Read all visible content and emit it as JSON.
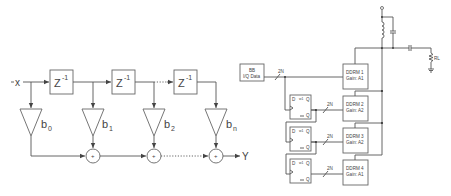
{
  "left_diagram": {
    "title": "FIR filter (tapped delay line)",
    "input_label": "x",
    "output_label": "Y",
    "delay_label": "Z",
    "delay_exponent": "-1",
    "adder_symbol": "+",
    "coefficients": [
      {
        "base": "b",
        "sub": "0"
      },
      {
        "base": "b",
        "sub": "1"
      },
      {
        "base": "b",
        "sub": "2"
      },
      {
        "base": "b",
        "sub": "n"
      }
    ]
  },
  "right_diagram": {
    "source_block": {
      "line1": "BB",
      "line2": "I/Q Data"
    },
    "bus_label": "2N",
    "flipflop": {
      "d": "D",
      "q": "Q",
      "qbar": "Q",
      "clk_mark": "w1"
    },
    "ddrm_blocks": [
      {
        "name": "DDRM 1",
        "gain": "Gain: A1"
      },
      {
        "name": "DDRM 2",
        "gain": "Gain: A2"
      },
      {
        "name": "DDRM 3",
        "gain": "Gain: A2"
      },
      {
        "name": "DDRM 4",
        "gain": "Gain: A1"
      }
    ],
    "load_label": "RL"
  }
}
